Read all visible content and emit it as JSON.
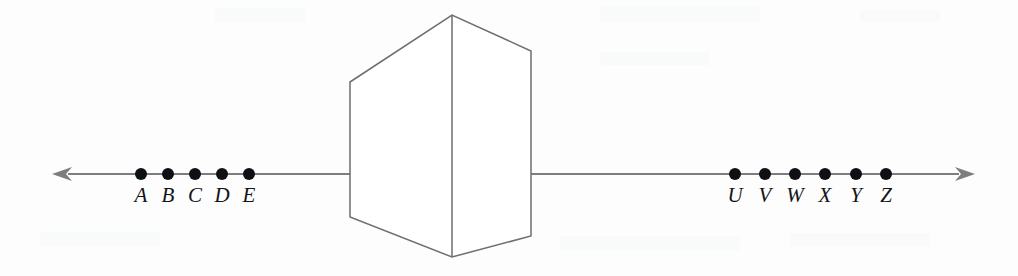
{
  "figure": {
    "background_color": "#fdfdfd",
    "line_color": "#7d7d80",
    "prism_stroke_color": "#6e6e72",
    "dot_color": "#101014",
    "label_color": "#141418",
    "width": 1018,
    "height": 276
  },
  "chart_data": {
    "type": "diagram",
    "title": "",
    "xlabel": "",
    "ylabel": "",
    "axis": {
      "orientation": "horizontal",
      "y": 174,
      "left_tip_x": 52,
      "right_tip_x": 975,
      "left_segment_end_x": 350,
      "right_segment_start_x": 531,
      "double_headed": true
    },
    "prism": {
      "top_apex": [
        452,
        15
      ],
      "bottom_apex": [
        452,
        257
      ],
      "left_top": [
        350,
        82
      ],
      "left_bottom": [
        350,
        217
      ],
      "right_top": [
        531,
        51
      ],
      "right_bottom": [
        531,
        236
      ],
      "center_edge_x": 452
    },
    "left_group": {
      "labels": [
        "A",
        "B",
        "C",
        "D",
        "E"
      ],
      "dot_x": [
        141,
        168,
        195,
        222,
        249
      ],
      "dot_y": 174,
      "dot_radius": 6,
      "label_y": 202,
      "label_x": [
        141,
        168,
        195,
        222,
        249
      ]
    },
    "right_group": {
      "labels": [
        "U",
        "V",
        "W",
        "X",
        "Y",
        "Z"
      ],
      "dot_x": [
        735,
        765,
        795,
        825,
        856,
        886
      ],
      "dot_y": 174,
      "dot_radius": 6,
      "label_y": 202,
      "label_x": [
        735,
        765,
        795,
        825,
        856,
        886
      ]
    }
  }
}
